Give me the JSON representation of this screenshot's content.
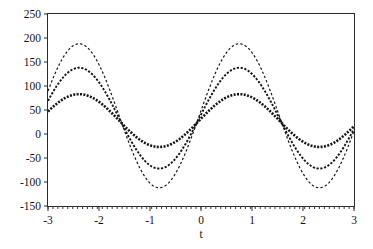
{
  "chart_data": {
    "type": "line",
    "title": "",
    "xlabel": "t",
    "ylabel": "",
    "xlim": [
      -3,
      3
    ],
    "ylim": [
      -150,
      250
    ],
    "grid": false,
    "legend": null,
    "x_ticks": [
      "-3",
      "-2",
      "-1",
      "0",
      "1",
      "2",
      "3"
    ],
    "x_tick_values": [
      -3,
      -2,
      -1,
      0,
      1,
      2,
      3
    ],
    "y_ticks": [
      "250",
      "200",
      "150",
      "100",
      "50",
      "0",
      "-50",
      "-100",
      "-150"
    ],
    "y_tick_values": [
      250,
      200,
      150,
      100,
      50,
      0,
      -50,
      -100,
      -150
    ],
    "minor_x_ticks_bottom": true,
    "line_style": "dashed",
    "series": [
      {
        "name": "curve-1",
        "amplitude": 55,
        "offset": 28,
        "phase_peak_t": 0.75,
        "period": 3.14,
        "color": "#151515",
        "dash": "2,1.4",
        "width": 2.6,
        "max": 83,
        "min": -27,
        "x": [
          -3.0,
          -2.8,
          -2.6,
          -2.4,
          -2.2,
          -2.0,
          -1.8,
          -1.6,
          -1.4,
          -1.2,
          -1.0,
          -0.8,
          -0.6,
          -0.4,
          -0.2,
          0.0,
          0.2,
          0.4,
          0.6,
          0.8,
          1.0,
          1.2,
          1.4,
          1.6,
          1.8,
          2.0,
          2.2,
          2.4,
          2.6,
          2.8,
          3.0
        ],
        "y": [
          19,
          43,
          63,
          77,
          83,
          79,
          67,
          48,
          25,
          1,
          -18,
          -27,
          -26,
          -15,
          3,
          25,
          47,
          66,
          79,
          83,
          78,
          64,
          44,
          20,
          -3,
          -21,
          -27,
          -24,
          -11,
          8,
          29
        ]
      },
      {
        "name": "curve-2",
        "amplitude": 105,
        "offset": 33,
        "phase_peak_t": 0.75,
        "period": 3.14,
        "color": "#151515",
        "dash": "2.2,1.6",
        "width": 1.9,
        "max": 147,
        "min": -83,
        "x": [
          -3.0,
          -2.8,
          -2.6,
          -2.4,
          -2.2,
          -2.0,
          -1.8,
          -1.6,
          -1.4,
          -1.2,
          -1.0,
          -0.8,
          -0.6,
          -0.4,
          -0.2,
          0.0,
          0.2,
          0.4,
          0.6,
          0.8,
          1.0,
          1.2,
          1.4,
          1.6,
          1.8,
          2.0,
          2.2,
          2.4,
          2.6,
          2.8,
          3.0
        ],
        "y": [
          30,
          75,
          112,
          136,
          147,
          139,
          115,
          79,
          34,
          -12,
          -50,
          -73,
          -78,
          -62,
          -30,
          10,
          54,
          94,
          126,
          146,
          144,
          122,
          82,
          33,
          -16,
          -55,
          -78,
          -81,
          -63,
          -27,
          17
        ]
      },
      {
        "name": "curve-3",
        "amplitude": 150,
        "offset": 38,
        "phase_peak_t": 0.75,
        "period": 3.14,
        "color": "#151515",
        "dash": "2.4,2.2",
        "width": 1.2,
        "max": 222,
        "min": -122,
        "x": [
          -3.0,
          -2.8,
          -2.6,
          -2.4,
          -2.2,
          -2.0,
          -1.8,
          -1.6,
          -1.4,
          -1.2,
          -1.0,
          -0.8,
          -0.6,
          -0.4,
          -0.2,
          0.0,
          0.2,
          0.4,
          0.6,
          0.8,
          1.0,
          1.2,
          1.4,
          1.6,
          1.8,
          2.0,
          2.2,
          2.4,
          2.6,
          2.8,
          3.0
        ],
        "y": [
          48,
          114,
          166,
          202,
          218,
          207,
          172,
          119,
          54,
          -12,
          -68,
          -102,
          -110,
          -88,
          -42,
          15,
          78,
          135,
          180,
          211,
          208,
          176,
          118,
          47,
          -24,
          -80,
          -114,
          -119,
          -92,
          -40,
          24
        ]
      }
    ]
  },
  "axis": {
    "x_label": "t"
  }
}
